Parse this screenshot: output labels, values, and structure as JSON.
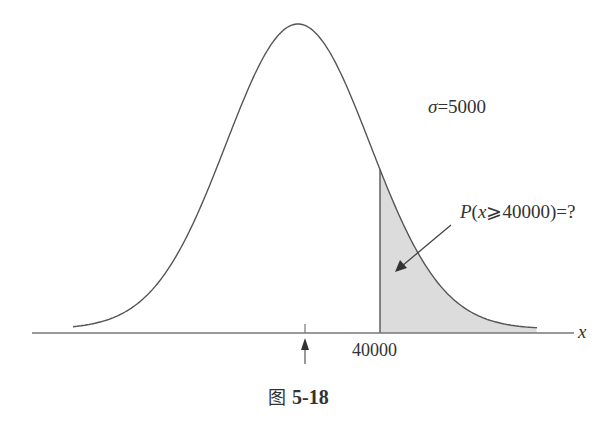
{
  "figure": {
    "caption_prefix": "图",
    "caption_number": "5-18",
    "sigma_symbol": "σ",
    "sigma_value": "=5000",
    "prob_label": {
      "P": "P",
      "open": "(",
      "var": "x",
      "relation": "⩾40000)=?"
    },
    "tick_label": "40000",
    "axis_variable": "x"
  },
  "chart_data": {
    "type": "area",
    "distribution": "normal",
    "sigma": 5000,
    "threshold": 40000,
    "shaded_region": "x >= 40000",
    "annotation": "P(x⩾40000)=?",
    "xlabel": "x",
    "x_tick_labels": [
      "40000"
    ],
    "mean_marker": "arrow under peak (unlabeled)",
    "grid": false,
    "legend": null
  },
  "colors": {
    "curve": "#555555",
    "shade": "#dcdcdc",
    "axis": "#777777",
    "text": "#333333"
  }
}
